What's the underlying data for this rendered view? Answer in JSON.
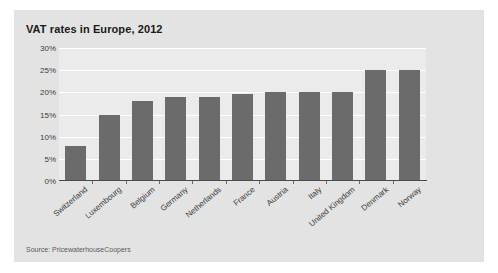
{
  "chart_data": {
    "type": "bar",
    "title": "VAT rates in Europe, 2012",
    "xlabel": "",
    "ylabel": "",
    "ylim": [
      0,
      30
    ],
    "ytick_labels": [
      "30%",
      "25%",
      "20%",
      "15%",
      "10%",
      "5%",
      "0%"
    ],
    "ytick_values": [
      30,
      25,
      20,
      15,
      10,
      5,
      0
    ],
    "grid": "horizontal",
    "legend": "none",
    "categories": [
      "Switzerland",
      "Luxembourg",
      "Belgium",
      "Germany",
      "Netherlands",
      "France",
      "Austria",
      "Italy",
      "United Kingdom",
      "Denmark",
      "Norway"
    ],
    "values": [
      8,
      15,
      18,
      19,
      19,
      19.6,
      20,
      20,
      20,
      25,
      25
    ],
    "value_unit": "%",
    "bar_color": "#6b6b6b",
    "annotations": [
      "Source: PricewaterhouseCoopers"
    ]
  },
  "figure": {
    "title": "VAT rates in Europe, 2012",
    "source": "Source: PricewaterhouseCoopers",
    "background": "#e3e3e3",
    "plot_background": "#ebebeb",
    "gridline_color": "#ffffff",
    "axis_color": "#4a4a4a"
  }
}
